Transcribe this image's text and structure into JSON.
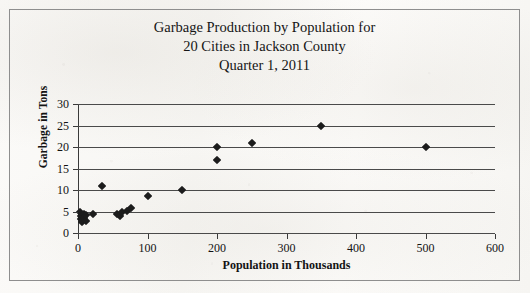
{
  "figure": {
    "border_color": "#8e8e8e",
    "background": "scanned-paper"
  },
  "title": {
    "line1": "Garbage Production by Population for",
    "line2": "20 Cities in Jackson County",
    "line3": "Quarter 1, 2011"
  },
  "ghost_text": {
    "a": "",
    "b": "",
    "c": ""
  },
  "chart_data": {
    "type": "scatter",
    "title": "Garbage Production by Population for 20 Cities in Jackson County Quarter 1, 2011",
    "xlabel": "Population in Thousands",
    "ylabel": "Garbage in Tons",
    "xlim": [
      0,
      600
    ],
    "ylim": [
      0,
      30
    ],
    "xticks": [
      0,
      100,
      200,
      300,
      400,
      500,
      600
    ],
    "yticks": [
      0,
      5,
      10,
      15,
      20,
      25,
      30
    ],
    "grid": "horizontal",
    "legend": "none",
    "marker": "diamond",
    "marker_color": "#1c1c1c",
    "points": [
      {
        "x": 3,
        "y": 4.8
      },
      {
        "x": 4,
        "y": 3.9
      },
      {
        "x": 5,
        "y": 3.2
      },
      {
        "x": 6,
        "y": 2.6
      },
      {
        "x": 8,
        "y": 4.4
      },
      {
        "x": 9,
        "y": 3.5
      },
      {
        "x": 11,
        "y": 2.9
      },
      {
        "x": 12,
        "y": 4.2
      },
      {
        "x": 21,
        "y": 4.5
      },
      {
        "x": 35,
        "y": 11.0
      },
      {
        "x": 56,
        "y": 4.4
      },
      {
        "x": 60,
        "y": 4.0
      },
      {
        "x": 64,
        "y": 4.9
      },
      {
        "x": 70,
        "y": 5.2
      },
      {
        "x": 76,
        "y": 5.9
      },
      {
        "x": 100,
        "y": 8.5
      },
      {
        "x": 150,
        "y": 10.0
      },
      {
        "x": 200,
        "y": 20.0
      },
      {
        "x": 200,
        "y": 17.0
      },
      {
        "x": 250,
        "y": 21.0
      },
      {
        "x": 350,
        "y": 25.0
      },
      {
        "x": 500,
        "y": 20.0
      }
    ]
  }
}
